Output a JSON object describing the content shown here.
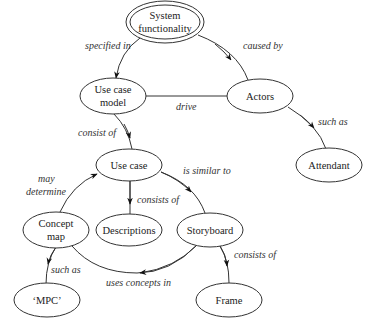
{
  "diagram": {
    "type": "concept-map",
    "nodes": {
      "system_functionality": {
        "line1": "System",
        "line2": "functionality"
      },
      "use_case_model": {
        "line1": "Use case",
        "line2": "model"
      },
      "actors": {
        "label": "Actors"
      },
      "attendant": {
        "label": "Attendant"
      },
      "use_case": {
        "label": "Use case"
      },
      "descriptions": {
        "label": "Descriptions"
      },
      "concept_map": {
        "line1": "Concept",
        "line2": "map"
      },
      "storyboard": {
        "label": "Storyboard"
      },
      "mpc": {
        "label": "‘MPC’"
      },
      "frame": {
        "label": "Frame"
      }
    },
    "edges": {
      "specified_in": {
        "label": "specified in",
        "from": "System functionality",
        "to": "Use case model"
      },
      "caused_by": {
        "label": "caused by",
        "from": "System functionality",
        "to": "Actors"
      },
      "drive": {
        "label": "drive",
        "from": "Actors",
        "to": "Use case model"
      },
      "such_as_attendant": {
        "label": "such as",
        "from": "Actors",
        "to": "Attendant"
      },
      "consist_of": {
        "label": "consist of",
        "from": "Use case model",
        "to": "Use case"
      },
      "consists_of_desc": {
        "label": "consists of",
        "from": "Use case",
        "to": "Descriptions"
      },
      "is_similar_to": {
        "label": "is similar to",
        "from": "Use case",
        "to": "Storyboard"
      },
      "may_determine_1": {
        "label": "may",
        "from": "Concept map",
        "to": "Use case"
      },
      "may_determine_2": {
        "label": "determine"
      },
      "such_as_mpc": {
        "label": "such as",
        "from": "Concept map",
        "to": "‘MPC’"
      },
      "uses_concepts_in": {
        "label": "uses concepts in",
        "from": "Storyboard",
        "to": "Concept map"
      },
      "consists_of_frame": {
        "label": "consists of",
        "from": "Storyboard",
        "to": "Frame"
      }
    }
  }
}
